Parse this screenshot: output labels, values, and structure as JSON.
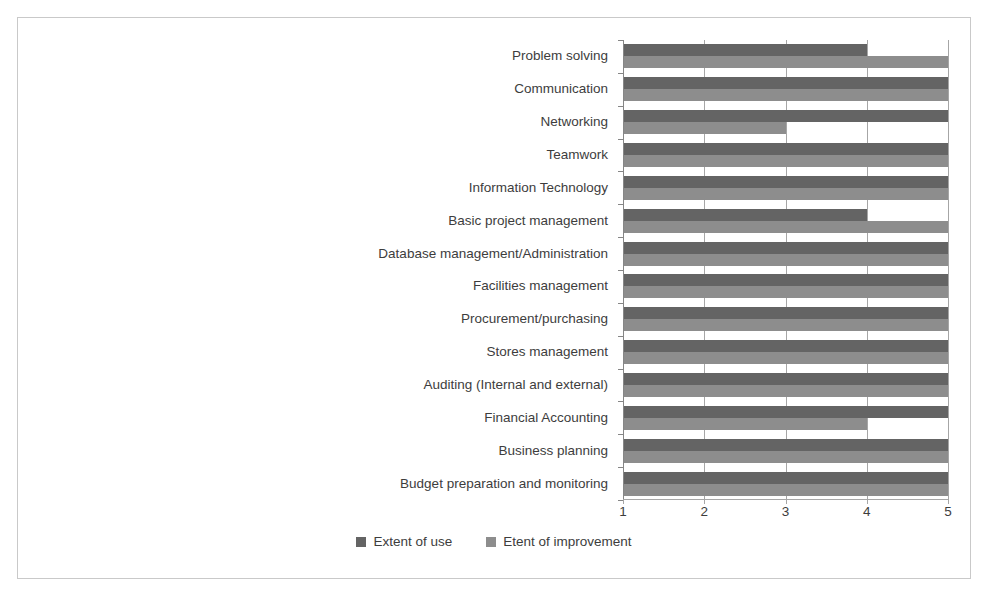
{
  "chart_data": {
    "type": "bar",
    "orientation": "horizontal",
    "title": "",
    "xlabel": "",
    "ylabel": "",
    "xlim": [
      1,
      5
    ],
    "xticks": [
      "1",
      "2",
      "3",
      "4",
      "5"
    ],
    "grid": true,
    "legend_position": "bottom",
    "categories": [
      "Problem solving",
      "Communication",
      "Networking",
      "Teamwork",
      "Information Technology",
      "Basic project management",
      "Database management/Administration",
      "Facilities management",
      "Procurement/purchasing",
      "Stores management",
      "Auditing (Internal and external)",
      "Financial Accounting",
      "Business planning",
      "Budget preparation and monitoring"
    ],
    "series": [
      {
        "name": "Extent of use",
        "color": "#646464",
        "values": [
          4,
          5,
          5,
          5,
          5,
          4,
          5,
          5,
          5,
          5,
          5,
          5,
          5,
          5
        ]
      },
      {
        "name": "Etent of improvement",
        "color": "#8d8d8d",
        "values": [
          5,
          5,
          3,
          5,
          5,
          5,
          5,
          5,
          5,
          5,
          5,
          4,
          5,
          5
        ]
      }
    ]
  },
  "legend": {
    "entries": [
      {
        "label": "Extent of use",
        "swatch": "legend-swatch-use"
      },
      {
        "label": "Etent of improvement",
        "swatch": "legend-swatch-improvement"
      }
    ]
  },
  "colors": {
    "extent_of_use": "#646464",
    "extent_of_improvement": "#8d8d8d",
    "gridline": "#a6a6a6",
    "axis": "#868686",
    "text": "#3d3d3d",
    "frame_border": "#c9c9c9",
    "background": "#ffffff"
  }
}
